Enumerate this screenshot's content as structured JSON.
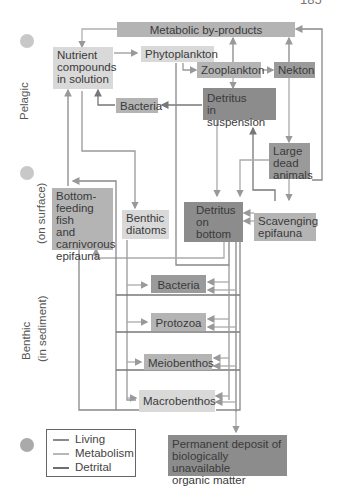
{
  "header": {
    "cut_text_left": "",
    "page_number": "185"
  },
  "side_labels": {
    "pelagic": "Pelagic",
    "benthic_surface": "(on surface)",
    "benthic_sediment_line1": "Benthic",
    "benthic_sediment_line2": "(in sediment)"
  },
  "nodes": {
    "metabolic_byproducts": "Metabolic by-products",
    "nutrient_compounds": [
      "Nutrient",
      "compounds",
      "in solution"
    ],
    "phytoplankton": "Phytoplankton",
    "zooplankton": "Zooplankton",
    "nekton": "Nekton",
    "bacteria_pelagic": "Bacteria",
    "detritus_suspension": [
      "Detritus",
      "in suspension"
    ],
    "large_dead_animals": [
      "Large",
      "dead",
      "animals"
    ],
    "bottom_feeding_fish": [
      "Bottom-",
      "feeding fish",
      "and",
      "carnivorous",
      "epifauna"
    ],
    "benthic_diatoms": [
      "Benthic",
      "diatoms"
    ],
    "detritus_bottom": [
      "Detritus",
      "on",
      "bottom"
    ],
    "scavenging_epifauna": [
      "Scavenging",
      "epifauna"
    ],
    "bacteria_benthic": "Bacteria",
    "protozoa": "Protozoa",
    "meiobenthos": "Meiobenthos",
    "macrobenthos": "Macrobenthos",
    "permanent_deposit": [
      "Permanent deposit of",
      "biologically unavailable",
      "organic matter"
    ]
  },
  "legend": {
    "items": [
      {
        "label": "Living",
        "color": "#8a8a8a"
      },
      {
        "label": "Metabolism",
        "color": "#b8b8b8"
      },
      {
        "label": "Detrital",
        "color": "#6e6e6e"
      }
    ]
  },
  "colors": {
    "light_box": "#d9d9d9",
    "mid_box": "#b4b4b4",
    "dark_box": "#9a9a9a",
    "dot": "#c8c8c8"
  }
}
